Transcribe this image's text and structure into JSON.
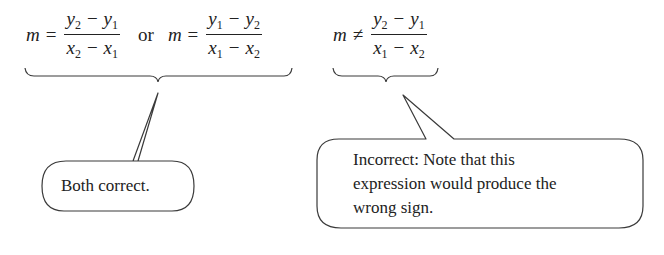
{
  "equations": {
    "correct_1": {
      "lhs": "m",
      "op": "=",
      "num": [
        "y",
        "2",
        "−",
        "y",
        "1"
      ],
      "den": [
        "x",
        "2",
        "−",
        "x",
        "1"
      ]
    },
    "connector": "or",
    "correct_2": {
      "lhs": "m",
      "op": "=",
      "num": [
        "y",
        "1",
        "−",
        "y",
        "2"
      ],
      "den": [
        "x",
        "1",
        "−",
        "x",
        "2"
      ]
    },
    "incorrect": {
      "lhs": "m",
      "op": "≠",
      "num": [
        "y",
        "2",
        "−",
        "y",
        "1"
      ],
      "den": [
        "x",
        "1",
        "−",
        "x",
        "2"
      ]
    }
  },
  "callouts": {
    "left": {
      "text": "Both correct."
    },
    "right": {
      "lines": [
        "Incorrect: Note that this",
        "expression would produce the",
        "wrong sign."
      ]
    }
  },
  "colors": {
    "stroke": "#3a3a3a",
    "text": "#222222",
    "background": "#ffffff"
  }
}
